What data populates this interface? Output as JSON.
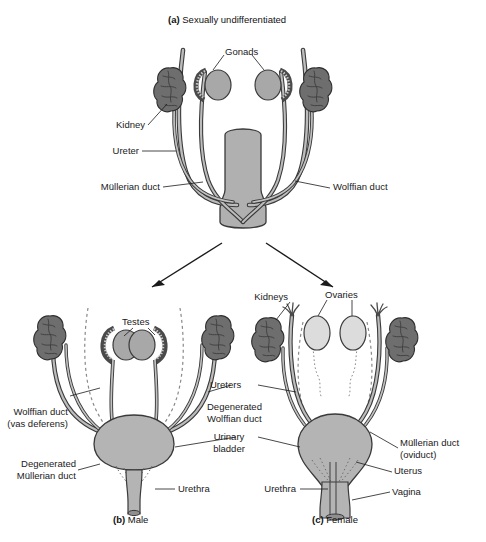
{
  "figure": {
    "background": "#ffffff",
    "ink": "#1a1a1a",
    "colors": {
      "kidney_fill": "#6e6e6e",
      "gonad_fill": "#a8a8a8",
      "ovary_fill": "#dcdcdc",
      "duct_fill": "#b4b4b4",
      "organ_fill": "#b0b0b0",
      "outline": "#3a3a3a",
      "dashed_duct": "#7a7a7a"
    }
  },
  "panels": {
    "a": {
      "caption_letter": "(a)",
      "caption_text": "Sexually undifferentiated",
      "labels": {
        "gonads": "Gonads",
        "kidney": "Kidney",
        "ureter": "Ureter",
        "mullerian_duct": "Müllerian duct",
        "wolffian_duct": "Wolffian duct"
      }
    },
    "b": {
      "caption_letter": "(b)",
      "caption_text": "Male",
      "labels": {
        "testes": "Testes",
        "wolffian_duct": "Wolffian duct\n(vas deferens)",
        "degenerated_mullerian": "Degenerated\nMüllerian duct",
        "urethra": "Urethra"
      }
    },
    "c": {
      "caption_letter": "(c)",
      "caption_text": "Female",
      "labels": {
        "ovaries": "Ovaries",
        "kidneys": "Kidneys",
        "mullerian_duct": "Müllerian duct\n(oviduct)",
        "uterus": "Uterus",
        "vagina": "Vagina",
        "urethra": "Urethra"
      }
    },
    "shared": {
      "ureters": "Ureters",
      "degenerated_wolffian": "Degenerated\nWolffian duct",
      "urinary_bladder": "Urinary\nbladder"
    }
  }
}
